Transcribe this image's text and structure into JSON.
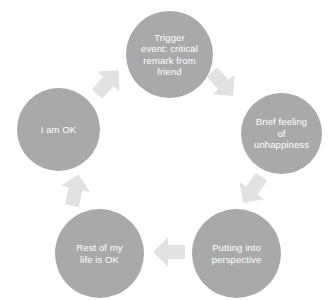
{
  "diagram": {
    "type": "cycle",
    "title": "",
    "direction": "clockwise",
    "colors": {
      "node_fill": "#a9a9a9",
      "node_text": "#ffffff",
      "arrow_fill": "#e2e2e2",
      "background": "#ffffff"
    },
    "nodes": [
      {
        "id": "trigger-event",
        "label": "Trigger\nevent: critical\nremark from\nfriend",
        "position": "top",
        "order": 1
      },
      {
        "id": "brief-unhappiness",
        "label": "Brief feeling\nof\nunhappiness",
        "position": "right",
        "order": 2
      },
      {
        "id": "putting-into-perspective",
        "label": "Putting into\nperspective",
        "position": "bottom-right",
        "order": 3
      },
      {
        "id": "rest-of-life-ok",
        "label": "Rest of my\nlife is OK",
        "position": "bottom-left",
        "order": 4
      },
      {
        "id": "i-am-ok",
        "label": "I am OK",
        "position": "left",
        "order": 5
      }
    ],
    "arrows": [
      {
        "id": "arrow-trigger-to-unhappiness",
        "from": "trigger-event",
        "to": "brief-unhappiness",
        "direction": "down-right"
      },
      {
        "id": "arrow-unhappiness-to-perspective",
        "from": "brief-unhappiness",
        "to": "putting-into-perspective",
        "direction": "down-left"
      },
      {
        "id": "arrow-perspective-to-rest-of-life",
        "from": "putting-into-perspective",
        "to": "rest-of-life-ok",
        "direction": "left"
      },
      {
        "id": "arrow-rest-of-life-to-i-am-ok",
        "from": "rest-of-life-ok",
        "to": "i-am-ok",
        "direction": "up-right"
      },
      {
        "id": "arrow-i-am-ok-to-trigger",
        "from": "i-am-ok",
        "to": "trigger-event",
        "direction": "up-right"
      }
    ]
  }
}
